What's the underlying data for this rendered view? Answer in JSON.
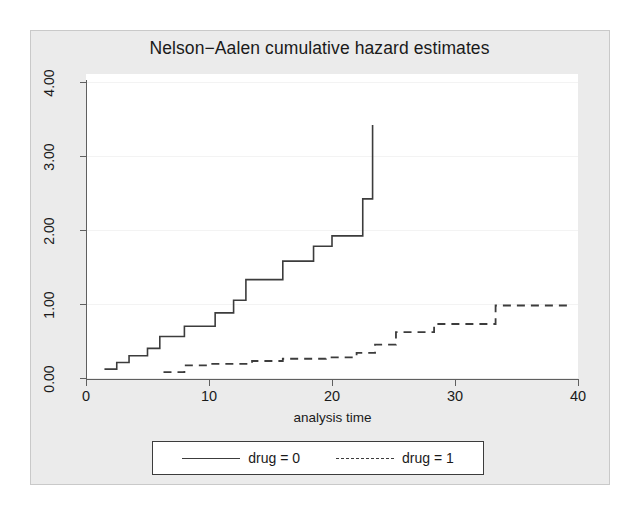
{
  "chart_data": {
    "type": "line",
    "subtype": "step",
    "title": "Nelson−Aalen cumulative hazard estimates",
    "xlabel": "analysis time",
    "ylabel": "",
    "xlim": [
      0,
      40
    ],
    "ylim": [
      0,
      4.4
    ],
    "xticks": [
      0,
      10,
      20,
      30,
      40
    ],
    "xtick_labels": [
      "0",
      "10",
      "20",
      "30",
      "40"
    ],
    "yticks": [
      0.0,
      1.0,
      2.0,
      3.0,
      4.0
    ],
    "ytick_labels": [
      "0.00",
      "1.00",
      "2.00",
      "3.00",
      "4.00"
    ],
    "grid": "horizontal",
    "legend_position": "below",
    "series": [
      {
        "name": "drug = 0",
        "style": "solid",
        "color": "#3c3c3c",
        "points": [
          [
            1.5,
            0.12
          ],
          [
            2.5,
            0.12
          ],
          [
            2.5,
            0.21
          ],
          [
            3.5,
            0.21
          ],
          [
            3.5,
            0.3
          ],
          [
            5.0,
            0.3
          ],
          [
            5.0,
            0.4
          ],
          [
            6.0,
            0.4
          ],
          [
            6.0,
            0.56
          ],
          [
            8.0,
            0.56
          ],
          [
            8.0,
            0.7
          ],
          [
            10.5,
            0.7
          ],
          [
            10.5,
            0.88
          ],
          [
            12.0,
            0.88
          ],
          [
            12.0,
            1.05
          ],
          [
            13.0,
            1.05
          ],
          [
            13.0,
            1.33
          ],
          [
            16.0,
            1.33
          ],
          [
            16.0,
            1.58
          ],
          [
            18.5,
            1.58
          ],
          [
            18.5,
            1.78
          ],
          [
            20.0,
            1.78
          ],
          [
            20.0,
            1.92
          ],
          [
            22.5,
            1.92
          ],
          [
            22.5,
            2.42
          ],
          [
            23.3,
            2.42
          ],
          [
            23.3,
            3.42
          ]
        ]
      },
      {
        "name": "drug = 1",
        "style": "dashed",
        "color": "#3c3c3c",
        "points": [
          [
            6.3,
            0.08
          ],
          [
            8.0,
            0.08
          ],
          [
            8.0,
            0.17
          ],
          [
            10.0,
            0.17
          ],
          [
            10.0,
            0.19
          ],
          [
            13.5,
            0.19
          ],
          [
            13.5,
            0.23
          ],
          [
            16.0,
            0.23
          ],
          [
            16.0,
            0.26
          ],
          [
            19.5,
            0.26
          ],
          [
            19.5,
            0.28
          ],
          [
            22.0,
            0.28
          ],
          [
            22.0,
            0.34
          ],
          [
            23.5,
            0.34
          ],
          [
            23.5,
            0.45
          ],
          [
            25.2,
            0.45
          ],
          [
            25.2,
            0.62
          ],
          [
            28.3,
            0.62
          ],
          [
            28.3,
            0.73
          ],
          [
            33.3,
            0.73
          ],
          [
            33.3,
            0.98
          ],
          [
            39.2,
            0.98
          ]
        ]
      }
    ]
  },
  "legend": {
    "entries": [
      {
        "label": "drug = 0",
        "style": "solid"
      },
      {
        "label": "drug = 1",
        "style": "dashed"
      }
    ]
  }
}
